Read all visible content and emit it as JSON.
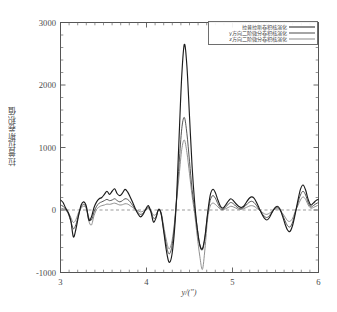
{
  "chart_data": {
    "type": "line",
    "title": "",
    "xlabel": "y/(″)",
    "ylabel": "拉普拉斯卷积值",
    "xlim": [
      3,
      6
    ],
    "ylim": [
      -1000,
      3000
    ],
    "xticks": [
      "3",
      "4",
      "5",
      "6"
    ],
    "xtick_values": [
      3,
      4,
      5,
      6
    ],
    "yticks": [
      "3000",
      "2000",
      "1000",
      "0",
      "-1000"
    ],
    "ytick_values": [
      3000,
      2000,
      1000,
      0,
      -1000
    ],
    "grid": false,
    "zero_line": true,
    "zero_line_style": "dashed",
    "legend_position": "top-right",
    "legend": [
      "拉普拉斯卷积核演化",
      "y方向二阶微分卷积核演化",
      "z方向二阶微分卷积核演化"
    ],
    "colors": [
      "#1c1c1c",
      "#4d4d4d",
      "#8a8a8a"
    ],
    "x": [
      3.0,
      3.03,
      3.06,
      3.09,
      3.12,
      3.15,
      3.18,
      3.21,
      3.24,
      3.27,
      3.3,
      3.33,
      3.36,
      3.39,
      3.42,
      3.45,
      3.48,
      3.51,
      3.54,
      3.57,
      3.6,
      3.63,
      3.66,
      3.69,
      3.72,
      3.75,
      3.78,
      3.81,
      3.84,
      3.87,
      3.9,
      3.93,
      3.96,
      3.99,
      4.02,
      4.05,
      4.08,
      4.11,
      4.14,
      4.17,
      4.2,
      4.23,
      4.26,
      4.29,
      4.32,
      4.35,
      4.38,
      4.41,
      4.44,
      4.47,
      4.5,
      4.53,
      4.56,
      4.59,
      4.62,
      4.65,
      4.68,
      4.71,
      4.74,
      4.77,
      4.8,
      4.83,
      4.86,
      4.89,
      4.92,
      4.95,
      4.98,
      5.01,
      5.04,
      5.07,
      5.1,
      5.13,
      5.16,
      5.19,
      5.22,
      5.25,
      5.28,
      5.31,
      5.34,
      5.37,
      5.4,
      5.43,
      5.46,
      5.49,
      5.52,
      5.55,
      5.58,
      5.61,
      5.64,
      5.67,
      5.7,
      5.73,
      5.76,
      5.79,
      5.82,
      5.85,
      5.88,
      5.91,
      5.94,
      5.97,
      6.0
    ],
    "series": [
      {
        "name": "拉普拉斯卷积核演化",
        "color": "#1c1c1c",
        "width": 1.15,
        "values": [
          160,
          120,
          30,
          -40,
          -170,
          -430,
          -300,
          -90,
          80,
          130,
          60,
          -160,
          -110,
          40,
          130,
          180,
          200,
          250,
          300,
          250,
          300,
          340,
          260,
          230,
          270,
          330,
          290,
          210,
          120,
          20,
          -60,
          -110,
          -70,
          10,
          70,
          -20,
          -190,
          -130,
          10,
          -60,
          -340,
          -640,
          -830,
          -760,
          -420,
          200,
          1200,
          2150,
          2650,
          2300,
          1500,
          700,
          120,
          -300,
          -560,
          -620,
          -420,
          -60,
          230,
          330,
          280,
          160,
          60,
          30,
          80,
          140,
          180,
          150,
          100,
          60,
          40,
          60,
          120,
          180,
          210,
          190,
          120,
          30,
          -60,
          -130,
          -160,
          -120,
          -40,
          30,
          60,
          20,
          -90,
          -220,
          -320,
          -340,
          -240,
          -60,
          150,
          330,
          400,
          320,
          170,
          80,
          110,
          150,
          170
        ]
      },
      {
        "name": "y方向二阶微分卷积核演化",
        "color": "#4d4d4d",
        "width": 0.95,
        "values": [
          80,
          60,
          10,
          -60,
          -180,
          -300,
          -230,
          -80,
          50,
          90,
          40,
          -130,
          -160,
          -30,
          60,
          110,
          130,
          150,
          170,
          150,
          160,
          180,
          150,
          130,
          150,
          180,
          170,
          130,
          70,
          10,
          -40,
          -70,
          -50,
          0,
          40,
          -20,
          -130,
          -110,
          0,
          -60,
          -320,
          -560,
          -700,
          -620,
          -320,
          180,
          760,
          1300,
          1480,
          1220,
          780,
          330,
          20,
          -280,
          -560,
          -640,
          -440,
          -80,
          150,
          230,
          190,
          100,
          30,
          10,
          50,
          90,
          120,
          100,
          60,
          30,
          20,
          40,
          80,
          120,
          140,
          120,
          70,
          10,
          -50,
          -100,
          -120,
          -90,
          -30,
          20,
          40,
          10,
          -70,
          -170,
          -250,
          -270,
          -190,
          -40,
          110,
          240,
          300,
          240,
          120,
          50,
          70,
          100,
          120
        ]
      },
      {
        "name": "z方向二阶微分卷积核演化",
        "color": "#8a8a8a",
        "width": 0.95,
        "values": [
          30,
          20,
          0,
          -40,
          -120,
          -200,
          -150,
          -40,
          30,
          60,
          20,
          -180,
          -240,
          -90,
          10,
          50,
          70,
          80,
          95,
          90,
          100,
          110,
          95,
          80,
          85,
          100,
          95,
          70,
          40,
          10,
          -10,
          -30,
          -20,
          0,
          20,
          -10,
          -80,
          -70,
          0,
          -40,
          -260,
          -480,
          -620,
          -540,
          -270,
          150,
          560,
          970,
          1120,
          920,
          580,
          230,
          -60,
          -420,
          -740,
          -950,
          -620,
          -150,
          60,
          110,
          90,
          50,
          10,
          0,
          20,
          40,
          60,
          50,
          30,
          10,
          10,
          20,
          40,
          60,
          70,
          60,
          30,
          0,
          -30,
          -60,
          -70,
          -50,
          -20,
          10,
          20,
          0,
          -50,
          -110,
          -170,
          -180,
          -130,
          -20,
          70,
          160,
          210,
          170,
          80,
          30,
          40,
          60,
          80
        ]
      }
    ]
  },
  "axes": {
    "ylabel": "拉普拉斯卷积值",
    "xlabel": "y/(″)",
    "ytick_0": "3000",
    "ytick_1": "2000",
    "ytick_2": "1000",
    "ytick_3": "0",
    "ytick_4": "-1000",
    "xtick_0": "3",
    "xtick_1": "4",
    "xtick_2": "5",
    "xtick_3": "6"
  }
}
